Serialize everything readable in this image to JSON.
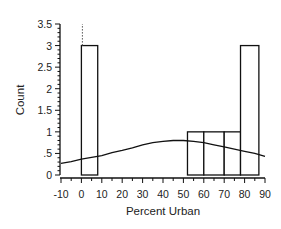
{
  "chart_data": {
    "type": "bar",
    "title": "",
    "xlabel": "Percent Urban",
    "ylabel": "Count",
    "xlim": [
      -10,
      90
    ],
    "ylim": [
      0,
      3.5
    ],
    "grid": false,
    "legend": "none",
    "x_ticks": [
      "-10",
      "0",
      "10",
      "20",
      "30",
      "40",
      "50",
      "60",
      "70",
      "80",
      "90"
    ],
    "x_tick_values": [
      -10,
      0,
      10,
      20,
      30,
      40,
      50,
      60,
      70,
      80,
      90
    ],
    "y_ticks": [
      "0",
      ".5",
      "1",
      "1.5",
      "2",
      "2.5",
      "3",
      "3.5"
    ],
    "y_tick_values": [
      0,
      0.5,
      1,
      1.5,
      2,
      2.5,
      3,
      3.5
    ],
    "bars": [
      {
        "x0": 0,
        "x1": 8,
        "count": 3
      },
      {
        "x0": 52,
        "x1": 60,
        "count": 1
      },
      {
        "x0": 60,
        "x1": 70,
        "count": 1
      },
      {
        "x0": 70,
        "x1": 78,
        "count": 1
      },
      {
        "x0": 78,
        "x1": 87,
        "count": 3
      }
    ],
    "series": [
      {
        "name": "density-curve",
        "type": "line",
        "x": [
          -10,
          -5,
          0,
          5,
          10,
          15,
          20,
          25,
          30,
          35,
          40,
          45,
          50,
          55,
          60,
          65,
          70,
          75,
          80,
          85,
          90
        ],
        "y": [
          0.27,
          0.31,
          0.37,
          0.41,
          0.45,
          0.52,
          0.57,
          0.63,
          0.7,
          0.75,
          0.78,
          0.8,
          0.8,
          0.78,
          0.75,
          0.7,
          0.65,
          0.6,
          0.55,
          0.5,
          0.43
        ]
      }
    ],
    "annotations": [
      {
        "type": "dotted-line",
        "x": 0,
        "from": 3,
        "to": 3.5
      }
    ]
  }
}
